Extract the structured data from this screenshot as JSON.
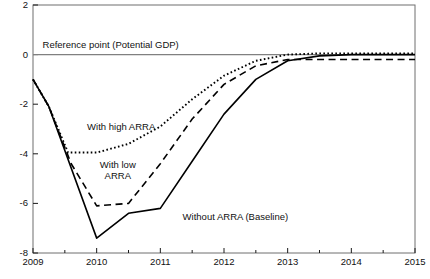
{
  "chart_data": {
    "type": "line",
    "title": "",
    "xlabel": "",
    "ylabel": "",
    "xlim": [
      2009,
      2015
    ],
    "ylim": [
      -8,
      2
    ],
    "grid": false,
    "legend": "inline-annotations",
    "yticks": [
      "2",
      "0",
      "-2",
      "-4",
      "-6",
      "-8"
    ],
    "ytick_values": [
      2,
      0,
      -2,
      -4,
      -6,
      -8
    ],
    "xticks": [
      "2009",
      "2010",
      "2011",
      "2012",
      "2013",
      "2014",
      "2015"
    ],
    "xtick_values": [
      2009,
      2010,
      2011,
      2012,
      2013,
      2014,
      2015
    ],
    "minor_xticks": [
      2009.5,
      2010.5,
      2011.5,
      2012.5,
      2013.5,
      2014.5
    ],
    "reference_line": {
      "label": "Reference point (Potential GDP)",
      "value": 0,
      "color": "#808080"
    },
    "series": [
      {
        "name": "Without ARRA (Baseline)",
        "style": "solid",
        "color": "#000000",
        "x": [
          2009.0,
          2009.25,
          2010.0,
          2010.5,
          2011.0,
          2011.5,
          2012.0,
          2012.5,
          2013.0,
          2013.5,
          2014.0,
          2014.5,
          2015.0
        ],
        "values": [
          -1.0,
          -2.1,
          -7.4,
          -6.4,
          -6.2,
          -4.3,
          -2.4,
          -1.0,
          -0.25,
          -0.05,
          0.0,
          0.0,
          0.0
        ]
      },
      {
        "name": "With low ARRA",
        "style": "dashed",
        "color": "#000000",
        "x": [
          2009.0,
          2009.25,
          2009.6,
          2010.0,
          2010.5,
          2011.0,
          2011.5,
          2012.0,
          2012.5,
          2013.0,
          2013.5,
          2014.0,
          2014.5,
          2015.0
        ],
        "values": [
          -1.0,
          -2.1,
          -4.4,
          -6.1,
          -6.0,
          -4.4,
          -2.6,
          -1.2,
          -0.45,
          -0.2,
          -0.2,
          -0.2,
          -0.2,
          -0.2
        ]
      },
      {
        "name": "With high ARRA",
        "style": "dotted",
        "color": "#000000",
        "x": [
          2009.0,
          2009.25,
          2009.55,
          2010.0,
          2010.5,
          2011.0,
          2011.5,
          2012.0,
          2012.5,
          2013.0,
          2013.5,
          2014.0,
          2014.5,
          2015.0
        ],
        "values": [
          -1.0,
          -2.1,
          -3.95,
          -3.95,
          -3.6,
          -2.9,
          -1.8,
          -0.85,
          -0.25,
          0.0,
          0.05,
          0.05,
          0.05,
          0.05
        ]
      }
    ],
    "annotations": [
      {
        "text": "With high ARRA",
        "x": 2009.85,
        "y": -2.9
      },
      {
        "text": "With low\nARRA",
        "x": 2010.05,
        "y": -4.45
      },
      {
        "text": "Without ARRA (Baseline)",
        "x": 2011.35,
        "y": -6.55
      }
    ]
  },
  "footnote": {
    "text": ""
  }
}
